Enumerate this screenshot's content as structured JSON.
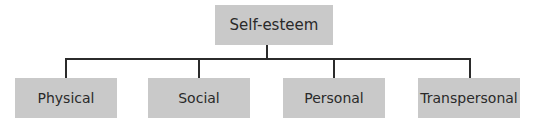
{
  "diagram": {
    "type": "hierarchy",
    "root": {
      "label": "Self-esteem"
    },
    "children": [
      {
        "label": "Physical"
      },
      {
        "label": "Social"
      },
      {
        "label": "Personal"
      },
      {
        "label": "Transpersonal"
      }
    ],
    "colors": {
      "box_fill": "#c9c9c9",
      "line": "#2b2b2b",
      "text": "#2a2a2a"
    }
  }
}
